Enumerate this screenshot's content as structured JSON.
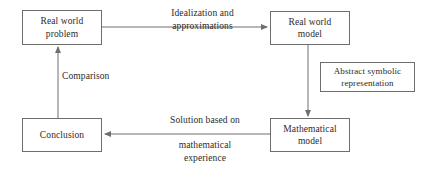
{
  "diagram": {
    "type": "flowchart",
    "canvas": {
      "width": 429,
      "height": 171,
      "background": "#ffffff"
    },
    "style": {
      "box_border": "#6e6e6e",
      "arrow": "#6e6e6e",
      "text": "#2b2b2b"
    },
    "nodes": [
      {
        "id": "real-world-problem",
        "label": "Real world\nproblem"
      },
      {
        "id": "real-world-model",
        "label": "Real world\nmodel"
      },
      {
        "id": "abstract-symbolic",
        "label": "Abstract symbolic\nrepresentation"
      },
      {
        "id": "mathematical-model",
        "label": "Mathematical\nmodel"
      },
      {
        "id": "conclusion",
        "label": "Conclusion"
      }
    ],
    "edges": [
      {
        "id": "problem-to-model",
        "from": "real-world-problem",
        "to": "real-world-model",
        "direction": "right",
        "label": "Idealization and\napproximations"
      },
      {
        "id": "model-to-math",
        "from": "real-world-model",
        "to": "mathematical-model",
        "direction": "down",
        "label": ""
      },
      {
        "id": "math-to-conclusion",
        "from": "mathematical-model",
        "to": "conclusion",
        "direction": "left",
        "label_above": "Solution based on",
        "label_below": "mathematical\nexperience"
      },
      {
        "id": "conclusion-to-problem",
        "from": "conclusion",
        "to": "real-world-problem",
        "direction": "up",
        "label": "Comparison"
      }
    ]
  }
}
